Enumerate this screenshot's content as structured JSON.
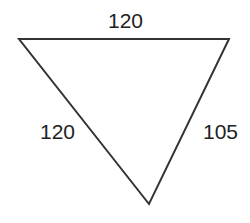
{
  "diagram": {
    "type": "triangle",
    "orientation": "inverted",
    "stroke_color": "#333333",
    "background_color": "#ffffff",
    "vertices": {
      "top_left": [
        19,
        39
      ],
      "top_right": [
        229,
        39
      ],
      "bottom": [
        149,
        204
      ]
    },
    "sides": [
      {
        "position": "top",
        "label": "120"
      },
      {
        "position": "left",
        "label": "120"
      },
      {
        "position": "right",
        "label": "105"
      }
    ]
  }
}
